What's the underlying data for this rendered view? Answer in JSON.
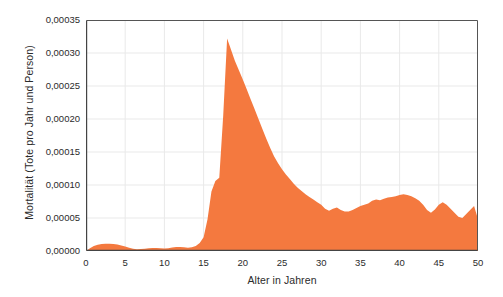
{
  "chart_data": {
    "type": "area",
    "title": "",
    "xlabel": "Alter in Jahren",
    "ylabel": "Mortalität (Tote pro Jahr und Person)",
    "xlim": [
      0,
      50
    ],
    "ylim": [
      0,
      0.00035
    ],
    "grid": true,
    "legend": false,
    "series_color": "#F4793F",
    "xticks": [
      "0",
      "5",
      "10",
      "15",
      "20",
      "25",
      "30",
      "35",
      "40",
      "45",
      "50"
    ],
    "xtick_values": [
      0,
      5,
      10,
      15,
      20,
      25,
      30,
      35,
      40,
      45,
      50
    ],
    "yticks": [
      "0,00000",
      "0,00005",
      "0,00010",
      "0,00015",
      "0,00020",
      "0,00025",
      "0,00030",
      "0,00035"
    ],
    "ytick_values": [
      0.0,
      5e-05,
      0.0001,
      0.00015,
      0.0002,
      0.00025,
      0.0003,
      0.00035
    ],
    "series": [
      {
        "name": "Mortalität",
        "x": [
          0,
          0.5,
          1,
          1.5,
          2,
          2.5,
          3,
          3.5,
          4,
          4.5,
          5,
          5.5,
          6,
          6.5,
          7,
          7.5,
          8,
          8.5,
          9,
          9.5,
          10,
          10.5,
          11,
          11.5,
          12,
          12.5,
          13,
          13.5,
          14,
          14.5,
          15,
          15.5,
          16,
          16.5,
          17,
          17.5,
          18,
          18.5,
          19,
          19.5,
          20,
          20.5,
          21,
          21.5,
          22,
          22.5,
          23,
          23.5,
          24,
          24.5,
          25,
          25.5,
          26,
          26.5,
          27,
          27.5,
          28,
          28.5,
          29,
          29.5,
          30,
          30.5,
          31,
          31.5,
          32,
          32.5,
          33,
          33.5,
          34,
          34.5,
          35,
          35.5,
          36,
          36.5,
          37,
          37.5,
          38,
          38.5,
          39,
          39.5,
          40,
          40.5,
          41,
          41.5,
          42,
          42.5,
          43,
          43.5,
          44,
          44.5,
          45,
          45.5,
          46,
          46.5,
          47,
          47.5,
          48,
          48.5,
          49,
          49.5,
          50
        ],
        "values": [
          0.0,
          4e-06,
          7.5e-06,
          9.5e-06,
          1.05e-05,
          1.1e-05,
          1.1e-05,
          1.05e-05,
          9.8e-06,
          8.5e-06,
          7e-06,
          5e-06,
          3.5e-06,
          2.8e-06,
          3e-06,
          3.5e-06,
          4.2e-06,
          4.5e-06,
          4.5e-06,
          4e-06,
          3.8e-06,
          4.2e-06,
          5.2e-06,
          6e-06,
          6.2e-06,
          5.5e-06,
          4.8e-06,
          5.5e-06,
          7.5e-06,
          1.2e-05,
          2.1e-05,
          4.8e-05,
          9e-05,
          0.000106,
          0.000111,
          0.000205,
          0.000322,
          0.000305,
          0.000288,
          0.000274,
          0.00026,
          0.000245,
          0.00023,
          0.000215,
          0.0002,
          0.000185,
          0.00017,
          0.000156,
          0.000143,
          0.000133,
          0.000124,
          0.000116,
          0.000109,
          0.000102,
          9.6e-05,
          9.1e-05,
          8.6e-05,
          8.2e-05,
          7.8e-05,
          7.4e-05,
          7e-05,
          6.4e-05,
          6.1e-05,
          6.4e-05,
          6.6e-05,
          6.2e-05,
          6e-05,
          6e-05,
          6.2e-05,
          6.5e-05,
          6.8e-05,
          7e-05,
          7.2e-05,
          7.6e-05,
          7.8e-05,
          7.7e-05,
          7.9e-05,
          8.1e-05,
          8.2e-05,
          8.3e-05,
          8.5e-05,
          8.6e-05,
          8.5e-05,
          8.3e-05,
          8e-05,
          7.6e-05,
          7e-05,
          6.2e-05,
          5.8e-05,
          6.3e-05,
          7e-05,
          7.4e-05,
          7e-05,
          6.4e-05,
          5.8e-05,
          5.2e-05,
          5e-05,
          5.6e-05,
          6.2e-05,
          6.8e-05,
          4.8e-05
        ]
      }
    ]
  }
}
